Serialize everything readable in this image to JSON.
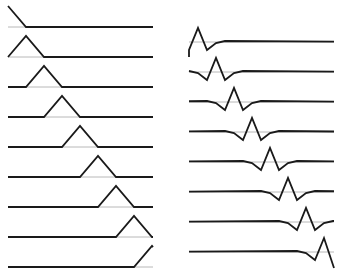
{
  "figure": {
    "colors": {
      "curve": "#1a1a1a",
      "baseline": "#b8b8b8",
      "background": "#ffffff"
    }
  },
  "left_column": {
    "x_start": 8,
    "x_end": 153,
    "baseline_y0": 27,
    "row_spacing": 30,
    "half_width": 18,
    "peak_height": 21,
    "rows": [
      {
        "peak_x": 8
      },
      {
        "peak_x": 26
      },
      {
        "peak_x": 44
      },
      {
        "peak_x": 62
      },
      {
        "peak_x": 80
      },
      {
        "peak_x": 98
      },
      {
        "peak_x": 116
      },
      {
        "peak_x": 134
      },
      {
        "peak_x": 152
      }
    ]
  },
  "right_column": {
    "x_start": 189,
    "x_end": 334,
    "baseline_y0": 42,
    "row_spacing": 30,
    "shape_offsets": [
      [
        -27,
        -1
      ],
      [
        -18,
        1
      ],
      [
        -9,
        8
      ],
      [
        0,
        -14
      ],
      [
        9,
        8
      ],
      [
        18,
        1
      ],
      [
        27,
        -1
      ]
    ],
    "rows": [
      {
        "peak_x": 198
      },
      {
        "peak_x": 216
      },
      {
        "peak_x": 234
      },
      {
        "peak_x": 252
      },
      {
        "peak_x": 270
      },
      {
        "peak_x": 288
      },
      {
        "peak_x": 306
      },
      {
        "peak_x": 324
      }
    ]
  }
}
